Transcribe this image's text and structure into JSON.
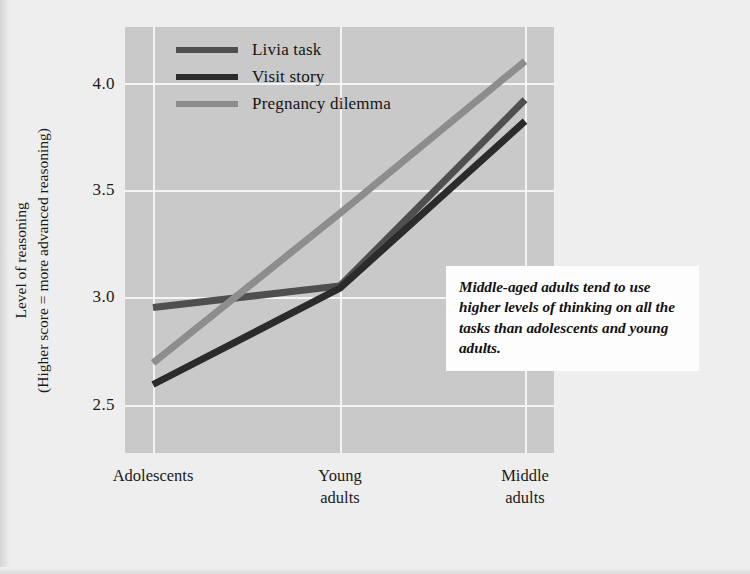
{
  "chart_data": {
    "type": "line",
    "title": "",
    "xlabel": "",
    "ylabel": "Level of reasoning (Higher score = more advanced reasoning)",
    "ylabel_line1": "Level of reasoning",
    "ylabel_line2": "(Higher score = more advanced reasoning)",
    "categories": [
      "Adolescents",
      "Young adults",
      "Middle adults"
    ],
    "category_lines": [
      [
        "Adolescents"
      ],
      [
        "Young",
        "adults"
      ],
      [
        "Middle",
        "adults"
      ]
    ],
    "x": [
      0,
      1,
      2
    ],
    "series": [
      {
        "name": "Livia task",
        "values": [
          2.96,
          3.06,
          3.93
        ],
        "color": "#4f4f4f"
      },
      {
        "name": "Visit story",
        "values": [
          2.6,
          3.05,
          3.83
        ],
        "color": "#2b2b2b"
      },
      {
        "name": "Pregnancy dilemma",
        "values": [
          2.7,
          3.4,
          4.11
        ],
        "color": "#8d8d8d"
      }
    ],
    "ylim": [
      2.28,
      4.27
    ],
    "yticks": [
      2.5,
      3.0,
      3.5,
      4.0
    ],
    "ytick_labels": [
      "2.5",
      "3.0",
      "3.5",
      "4.0"
    ],
    "grid": true,
    "grid_color": "#f4f4f4",
    "legend_position": "top-left inside",
    "plot_background": "#c9c9c9",
    "figure_background": "#eeeeee",
    "annotation": "Middle-aged adults tend to use higher levels of thinking on all the tasks than adolescents and young adults."
  },
  "legend": {
    "items": [
      {
        "label": "Livia task",
        "color": "#4f4f4f"
      },
      {
        "label": "Visit story",
        "color": "#2b2b2b"
      },
      {
        "label": "Pregnancy dilemma",
        "color": "#8d8d8d"
      }
    ]
  }
}
